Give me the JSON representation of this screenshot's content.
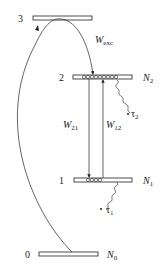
{
  "diagram": {
    "type": "energy-level diagram",
    "levels": [
      {
        "index_label": "3",
        "population_label": ""
      },
      {
        "index_label": "2",
        "population_label": "N",
        "population_sub": "2"
      },
      {
        "index_label": "1",
        "population_label": "N",
        "population_sub": "1"
      },
      {
        "index_label": "0",
        "population_label": "N",
        "population_sub": "0"
      }
    ],
    "transitions": {
      "excitation": {
        "label": "W",
        "sub": "exc"
      },
      "stimulated_emission": {
        "label": "W",
        "sub": "21"
      },
      "absorption": {
        "label": "W",
        "sub": "12"
      },
      "decay_2": {
        "label": "τ",
        "sub": "2"
      },
      "decay_1": {
        "label": "τ",
        "sub": "1"
      }
    },
    "colors": {
      "line": "#222222",
      "background": "#ffffff"
    }
  }
}
